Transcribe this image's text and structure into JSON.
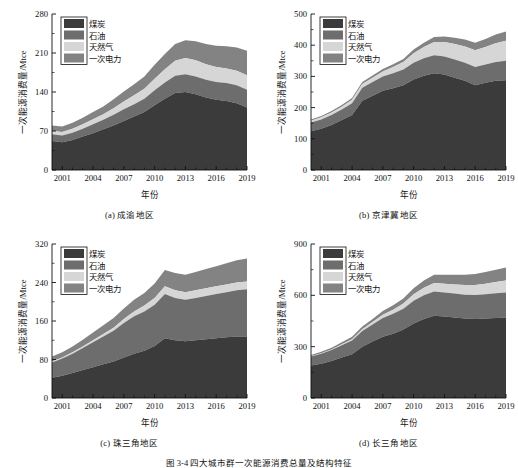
{
  "figure": {
    "caption": "图 3-4  四大城市群一次能源消费总量及结构特征",
    "axis": {
      "xlabel": "年份",
      "ylabel": "一次能源消费量/Mtce"
    },
    "legend": {
      "items": [
        {
          "label": "煤炭",
          "color": "#3b3b3b"
        },
        {
          "label": "石油",
          "color": "#6d6d6d"
        },
        {
          "label": "天然气",
          "color": "#d6d6d6"
        },
        {
          "label": "一次电力",
          "color": "#838383"
        }
      ]
    }
  },
  "chart_data": [
    {
      "type": "area",
      "title": "(a) 成渝地区",
      "xlabel": "年份",
      "ylabel": "一次能源消费量/Mtce",
      "xlim": [
        2000,
        2019
      ],
      "ylim": [
        0,
        280
      ],
      "yticks": [
        0,
        70,
        140,
        210,
        280
      ],
      "xticks": [
        2001,
        2004,
        2007,
        2010,
        2013,
        2016,
        2019
      ],
      "grid": false,
      "legend_position": "top-left",
      "x": [
        2000,
        2001,
        2002,
        2003,
        2004,
        2005,
        2006,
        2007,
        2008,
        2009,
        2010,
        2011,
        2012,
        2013,
        2014,
        2015,
        2016,
        2017,
        2018,
        2019
      ],
      "series": [
        {
          "name": "煤炭",
          "color": "#3b3b3b",
          "values": [
            52,
            50,
            54,
            60,
            66,
            73,
            80,
            88,
            96,
            104,
            116,
            128,
            138,
            140,
            136,
            130,
            126,
            124,
            120,
            112
          ]
        },
        {
          "name": "石油",
          "color": "#6d6d6d",
          "values": [
            12,
            12,
            13,
            14,
            16,
            17,
            19,
            21,
            22,
            24,
            27,
            29,
            31,
            32,
            32,
            32,
            32,
            32,
            32,
            32
          ]
        },
        {
          "name": "天然气",
          "color": "#d6d6d6",
          "values": [
            6,
            6,
            7,
            8,
            9,
            10,
            12,
            14,
            16,
            18,
            21,
            24,
            27,
            29,
            29,
            28,
            27,
            26,
            26,
            26
          ]
        },
        {
          "name": "一次电力",
          "color": "#838383",
          "values": [
            10,
            10,
            11,
            12,
            13,
            14,
            16,
            18,
            20,
            22,
            25,
            27,
            30,
            32,
            34,
            36,
            38,
            40,
            42,
            44
          ]
        }
      ],
      "totals": [
        80,
        78,
        85,
        94,
        104,
        114,
        127,
        141,
        154,
        168,
        189,
        208,
        226,
        233,
        231,
        226,
        223,
        222,
        220,
        214
      ]
    },
    {
      "type": "area",
      "title": "(b) 京津冀地区",
      "xlabel": "年份",
      "ylabel": "一次能源消费量/Mtce",
      "xlim": [
        2000,
        2019
      ],
      "ylim": [
        0,
        500
      ],
      "yticks": [
        0,
        100,
        200,
        300,
        400,
        500
      ],
      "xticks": [
        2001,
        2004,
        2007,
        2010,
        2013,
        2016,
        2019
      ],
      "grid": false,
      "legend_position": "top-left",
      "x": [
        2000,
        2001,
        2002,
        2003,
        2004,
        2005,
        2006,
        2007,
        2008,
        2009,
        2010,
        2011,
        2012,
        2013,
        2014,
        2015,
        2016,
        2017,
        2018,
        2019
      ],
      "series": [
        {
          "name": "煤炭",
          "color": "#3b3b3b",
          "values": [
            124,
            132,
            144,
            160,
            176,
            222,
            238,
            254,
            262,
            272,
            290,
            302,
            310,
            306,
            296,
            286,
            272,
            280,
            286,
            288
          ]
        },
        {
          "name": "石油",
          "color": "#6d6d6d",
          "values": [
            28,
            30,
            32,
            34,
            38,
            42,
            44,
            46,
            48,
            50,
            54,
            56,
            58,
            58,
            58,
            58,
            58,
            58,
            60,
            62
          ]
        },
        {
          "name": "天然气",
          "color": "#d6d6d6",
          "values": [
            6,
            7,
            8,
            9,
            11,
            12,
            14,
            16,
            20,
            24,
            30,
            36,
            42,
            46,
            50,
            52,
            54,
            56,
            60,
            64
          ]
        },
        {
          "name": "一次电力",
          "color": "#838383",
          "values": [
            4,
            4,
            5,
            5,
            6,
            6,
            7,
            8,
            9,
            10,
            12,
            14,
            16,
            18,
            20,
            22,
            24,
            26,
            28,
            30
          ]
        }
      ],
      "totals": [
        162,
        173,
        189,
        208,
        231,
        282,
        303,
        324,
        339,
        356,
        386,
        408,
        426,
        428,
        424,
        418,
        408,
        420,
        434,
        444
      ]
    },
    {
      "type": "area",
      "title": "(c) 珠三角地区",
      "xlabel": "年份",
      "ylabel": "一次能源消费量/Mtce",
      "xlim": [
        2000,
        2019
      ],
      "ylim": [
        0,
        320
      ],
      "yticks": [
        0,
        80,
        160,
        240,
        320
      ],
      "xticks": [
        2001,
        2004,
        2007,
        2010,
        2013,
        2016,
        2019
      ],
      "grid": false,
      "legend_position": "top-left",
      "x": [
        2000,
        2001,
        2002,
        2003,
        2004,
        2005,
        2006,
        2007,
        2008,
        2009,
        2010,
        2011,
        2012,
        2013,
        2014,
        2015,
        2016,
        2017,
        2018,
        2019
      ],
      "series": [
        {
          "name": "煤炭",
          "color": "#3b3b3b",
          "values": [
            42,
            46,
            52,
            58,
            64,
            70,
            76,
            84,
            92,
            98,
            108,
            124,
            120,
            118,
            120,
            122,
            124,
            126,
            128,
            128
          ]
        },
        {
          "name": "石油",
          "color": "#6d6d6d",
          "values": [
            32,
            36,
            40,
            46,
            52,
            58,
            64,
            72,
            78,
            82,
            86,
            92,
            88,
            86,
            88,
            90,
            92,
            94,
            96,
            98
          ]
        },
        {
          "name": "天然气",
          "color": "#d6d6d6",
          "values": [
            2,
            2,
            3,
            3,
            4,
            5,
            6,
            8,
            10,
            12,
            14,
            16,
            16,
            16,
            16,
            16,
            16,
            16,
            16,
            16
          ]
        },
        {
          "name": "一次电力",
          "color": "#838383",
          "values": [
            10,
            11,
            12,
            14,
            16,
            18,
            20,
            22,
            24,
            26,
            30,
            34,
            36,
            36,
            38,
            40,
            42,
            44,
            46,
            48
          ]
        }
      ],
      "totals": [
        86,
        95,
        107,
        121,
        136,
        151,
        166,
        186,
        204,
        218,
        238,
        266,
        260,
        256,
        262,
        268,
        274,
        280,
        286,
        290
      ]
    },
    {
      "type": "area",
      "title": "(d) 长三角地区",
      "xlabel": "年份",
      "ylabel": "一次能源消费量/Mtce",
      "xlim": [
        2000,
        2019
      ],
      "ylim": [
        0,
        900
      ],
      "yticks": [
        0,
        300,
        600,
        900
      ],
      "xticks": [
        2001,
        2004,
        2007,
        2010,
        2013,
        2016,
        2019
      ],
      "grid": false,
      "legend_position": "top-left",
      "x": [
        2000,
        2001,
        2002,
        2003,
        2004,
        2005,
        2006,
        2007,
        2008,
        2009,
        2010,
        2011,
        2012,
        2013,
        2014,
        2015,
        2016,
        2017,
        2018,
        2019
      ],
      "series": [
        {
          "name": "煤炭",
          "color": "#3b3b3b",
          "values": [
            190,
            200,
            216,
            236,
            256,
            300,
            330,
            358,
            376,
            400,
            436,
            462,
            480,
            476,
            470,
            464,
            462,
            464,
            468,
            470
          ]
        },
        {
          "name": "石油",
          "color": "#6d6d6d",
          "values": [
            52,
            58,
            64,
            72,
            80,
            92,
            100,
            110,
            116,
            122,
            132,
            138,
            142,
            140,
            140,
            140,
            140,
            142,
            144,
            146
          ]
        },
        {
          "name": "天然气",
          "color": "#d6d6d6",
          "values": [
            2,
            3,
            4,
            6,
            8,
            10,
            14,
            18,
            24,
            30,
            38,
            44,
            50,
            52,
            54,
            56,
            58,
            62,
            66,
            70
          ]
        },
        {
          "name": "一次电力",
          "color": "#838383",
          "values": [
            8,
            9,
            10,
            12,
            14,
            16,
            18,
            22,
            26,
            30,
            36,
            42,
            48,
            52,
            56,
            60,
            64,
            68,
            72,
            76
          ]
        }
      ],
      "totals": [
        252,
        270,
        294,
        326,
        358,
        418,
        462,
        508,
        542,
        582,
        642,
        686,
        720,
        720,
        720,
        720,
        724,
        736,
        750,
        762
      ]
    }
  ]
}
